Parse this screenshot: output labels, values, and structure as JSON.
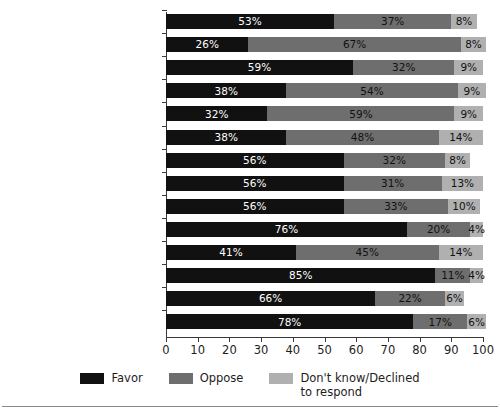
{
  "chart_data": {
    "type": "bar",
    "orientation": "horizontal",
    "stacked": true,
    "title": "",
    "xlabel": "",
    "ylabel": "",
    "xlim": [
      0,
      100
    ],
    "xticks": [
      0,
      10,
      20,
      30,
      40,
      50,
      60,
      70,
      80,
      90,
      100
    ],
    "xtick_labels": [
      "0",
      "10",
      "20",
      "30",
      "40",
      "50",
      "60",
      "70",
      "80",
      "90",
      "100"
    ],
    "grid": false,
    "legend_position": "bottom-center",
    "value_suffix": "%",
    "categories": [
      "All Americans",
      "White evangelical Protestant",
      "White mainline Protestant",
      "Black Protestant",
      "Hispanic Protestant",
      "Other non-White Protestant",
      "White Catholic",
      "Hispanic Catholic",
      "Other non-White Catholic",
      "Jewish",
      "Muslim",
      "Buddhist",
      "Hindu",
      "Unaffiliated"
    ],
    "series": [
      {
        "name": "Favor",
        "color": "#111111",
        "values": [
          53,
          26,
          59,
          38,
          32,
          38,
          56,
          56,
          56,
          76,
          41,
          85,
          66,
          78
        ]
      },
      {
        "name": "Oppose",
        "color": "#6e6e6e",
        "values": [
          37,
          67,
          32,
          54,
          59,
          48,
          32,
          31,
          33,
          20,
          45,
          11,
          22,
          17
        ]
      },
      {
        "name": "Don't know/Declined to respond",
        "color": "#b0b0b0",
        "values": [
          8,
          8,
          9,
          9,
          9,
          14,
          8,
          13,
          10,
          4,
          14,
          4,
          6,
          6
        ]
      }
    ]
  },
  "legend": {
    "items": [
      {
        "label": "Favor",
        "color": "#111111"
      },
      {
        "label": "Oppose",
        "color": "#6e6e6e"
      },
      {
        "label": "Don't know/Declined\nto respond",
        "color": "#b0b0b0"
      }
    ]
  }
}
